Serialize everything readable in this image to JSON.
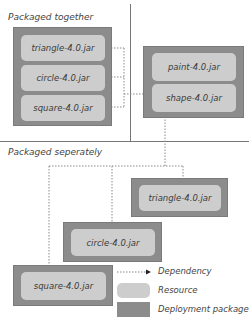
{
  "sections": {
    "together_label": "Packaged together",
    "separately_label": "Packaged seperately"
  },
  "together_package": {
    "resources": [
      "triangle-4.0.jar",
      "circle-4.0.jar",
      "square-4.0.jar"
    ]
  },
  "target_package": {
    "resources": [
      "paint-4.0.jar",
      "shape-4.0.jar"
    ]
  },
  "separate_packages": [
    {
      "resource": "triangle-4.0.jar"
    },
    {
      "resource": "circle-4.0.jar"
    },
    {
      "resource": "square-4.0.jar"
    }
  ],
  "legend": {
    "dependency": "Dependency",
    "resource": "Resource",
    "deployment_package": "Deployment package"
  },
  "colors": {
    "deployment_package": "#8c8c8c",
    "resource": "#cdcdcd",
    "dependency_line": "#888888"
  }
}
